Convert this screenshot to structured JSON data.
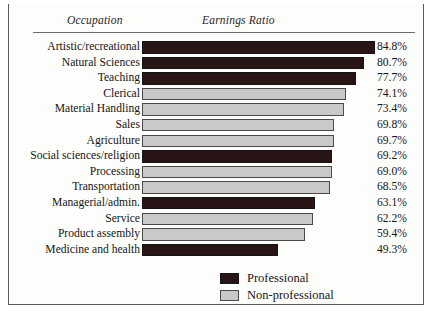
{
  "header": {
    "col_occupation": "Occupation",
    "col_ratio": "Earnings Ratio"
  },
  "legend": {
    "professional": "Professional",
    "nonprofessional": "Non-professional"
  },
  "chart_data": {
    "type": "bar",
    "orientation": "horizontal",
    "title": "",
    "xlabel": "Earnings Ratio",
    "ylabel": "Occupation",
    "xlim": [
      0,
      100
    ],
    "grid": false,
    "legend_position": "bottom-center",
    "value_suffix": "%",
    "colors": {
      "professional": "#2a1516",
      "nonprofessional": "#c9c9c9"
    },
    "categories": [
      "Artistic/recreational",
      "Natural Sciences",
      "Teaching",
      "Clerical",
      "Material Handling",
      "Sales",
      "Agriculture",
      "Social sciences/religion",
      "Processing",
      "Transportation",
      "Managerial/admin.",
      "Service",
      "Product assembly",
      "Medicine and health"
    ],
    "values": [
      84.8,
      80.7,
      77.7,
      74.1,
      73.4,
      69.8,
      69.7,
      69.2,
      69.0,
      68.5,
      63.1,
      62.2,
      59.4,
      49.3
    ],
    "value_labels": [
      "84.8%",
      "80.7%",
      "77.7%",
      "74.1%",
      "73.4%",
      "69.8%",
      "69.7%",
      "69.2%",
      "69.0%",
      "68.5%",
      "63.1%",
      "62.2%",
      "59.4%",
      "49.3%"
    ],
    "groups": [
      "professional",
      "professional",
      "professional",
      "nonprofessional",
      "nonprofessional",
      "nonprofessional",
      "nonprofessional",
      "professional",
      "nonprofessional",
      "nonprofessional",
      "professional",
      "nonprofessional",
      "nonprofessional",
      "professional"
    ]
  }
}
